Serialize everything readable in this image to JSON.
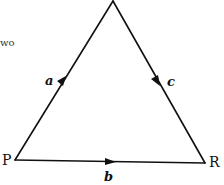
{
  "text_fragment": "wo",
  "triangle": {
    "vertices": {
      "P": {
        "label": "P"
      },
      "R": {
        "label": "R"
      },
      "apex": {
        "label": ""
      }
    },
    "edges": [
      {
        "id": "a",
        "label": "a",
        "from": "P",
        "to": "apex",
        "direction": "P to apex"
      },
      {
        "id": "c",
        "label": "c",
        "from": "apex",
        "to": "R",
        "direction": "apex to R"
      },
      {
        "id": "b",
        "label": "b",
        "from": "P",
        "to": "R",
        "direction": "P to R"
      }
    ]
  },
  "colors": {
    "line": "#111111",
    "background": "#ffffff"
  }
}
